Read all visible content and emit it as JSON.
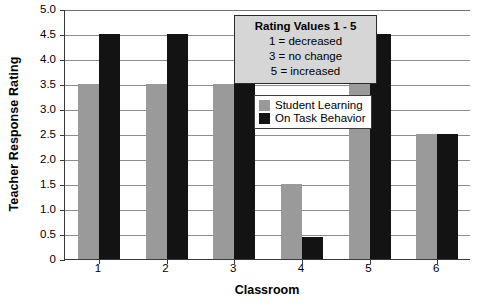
{
  "chart_data": {
    "type": "bar",
    "title": "",
    "xlabel": "Classroom",
    "ylabel": "Teacher Response Rating",
    "categories": [
      "1",
      "2",
      "3",
      "4",
      "5",
      "6"
    ],
    "series": [
      {
        "name": "Student Learning",
        "color": "#9a9a9a",
        "values": [
          3.5,
          3.5,
          3.5,
          1.5,
          3.5,
          2.5
        ]
      },
      {
        "name": "On Task Behavior",
        "color": "#131313",
        "values": [
          4.5,
          4.5,
          4.5,
          0.45,
          4.5,
          2.5
        ]
      }
    ],
    "ylim": [
      0,
      5.0
    ],
    "ytick_labels": [
      "5.0",
      "4.5",
      "4.0",
      "3.5",
      "3.0",
      "2.5",
      "2.0",
      "1.5",
      "1.0",
      "0.5",
      "0"
    ],
    "ytick_values": [
      5.0,
      4.5,
      4.0,
      3.5,
      3.0,
      2.5,
      2.0,
      1.5,
      1.0,
      0.5,
      0
    ],
    "grid": true,
    "legend_position": "inside-top-right"
  },
  "rating_box": {
    "title": "Rating Values 1 - 5",
    "lines": [
      "1 = decreased",
      "3 = no change",
      "5 = increased"
    ]
  }
}
